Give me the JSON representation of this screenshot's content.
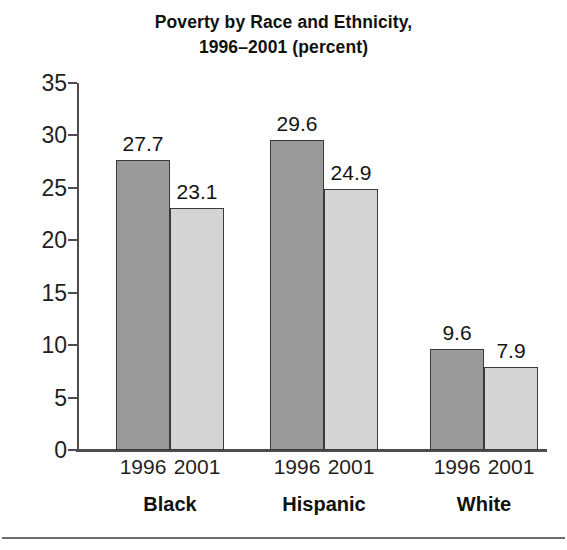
{
  "chart_data": {
    "type": "bar",
    "title": "Poverty by Race and Ethnicity, 1996–2001 (percent)",
    "title_lines": [
      "Poverty by Race and Ethnicity,",
      "1996–2001 (percent)"
    ],
    "xlabel": "",
    "ylabel": "",
    "ylim": [
      0,
      35
    ],
    "yticks": [
      0,
      5,
      10,
      15,
      20,
      25,
      30,
      35
    ],
    "ytick_labels": [
      "0",
      "5",
      "10",
      "15",
      "20",
      "25",
      "30",
      "35"
    ],
    "grid": false,
    "legend": false,
    "legend_position": "none",
    "categories": [
      "Black",
      "Hispanic",
      "White"
    ],
    "series": [
      {
        "name": "1996",
        "color": "#9a9a9a",
        "values": [
          27.7,
          29.6,
          9.6
        ],
        "labels": [
          "27.7",
          "29.6",
          "9.6"
        ]
      },
      {
        "name": "2001",
        "color": "#d4d4d4",
        "values": [
          23.1,
          24.9,
          7.9
        ],
        "labels": [
          "23.1",
          "24.9",
          "7.9"
        ]
      }
    ],
    "groups": [
      {
        "category": "Black",
        "bars": [
          {
            "series": "1996",
            "value": 27.7,
            "label": "27.7",
            "year_label": "1996"
          },
          {
            "series": "2001",
            "value": 23.1,
            "label": "23.1",
            "year_label": "2001"
          }
        ]
      },
      {
        "category": "Hispanic",
        "bars": [
          {
            "series": "1996",
            "value": 29.6,
            "label": "29.6",
            "year_label": "1996"
          },
          {
            "series": "2001",
            "value": 24.9,
            "label": "24.9",
            "year_label": "2001"
          }
        ]
      },
      {
        "category": "White",
        "bars": [
          {
            "series": "1996",
            "value": 9.6,
            "label": "9.6",
            "year_label": "1996"
          },
          {
            "series": "2001",
            "value": 7.9,
            "label": "7.9",
            "year_label": "2001"
          }
        ]
      }
    ]
  },
  "colors": {
    "series_1996": "#9a9a9a",
    "series_2001": "#d4d4d4",
    "bar_outline": "#3a3a3a",
    "axis": "#4d4d4d",
    "text": "#1a1a1a",
    "background": "#ffffff",
    "rule": "#6e6e6e"
  }
}
